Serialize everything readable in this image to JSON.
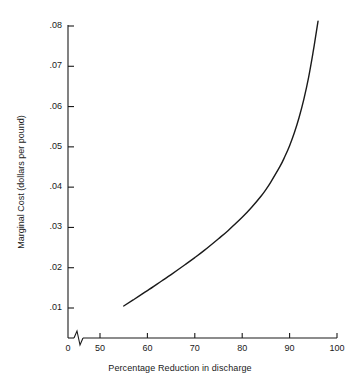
{
  "chart_data": {
    "type": "line",
    "title": "",
    "subtitle": "",
    "xlabel": "Percentage Reduction in discharge",
    "ylabel": "Marginal Cost (dollars per pound)",
    "xlim": [
      50,
      100
    ],
    "ylim": [
      0,
      0.08
    ],
    "grid": false,
    "legend": "none",
    "x_axis_break": true,
    "x_axis_break_note": "axis broken between 0 and 50",
    "xticks": [
      "0",
      "50",
      "60",
      "70",
      "80",
      "90",
      "100"
    ],
    "xtick_values": [
      0,
      50,
      60,
      70,
      80,
      90,
      100
    ],
    "yticks": [
      ".01",
      ".02",
      ".03",
      ".04",
      ".05",
      ".06",
      ".07",
      ".08"
    ],
    "ytick_values": [
      0.01,
      0.02,
      0.03,
      0.04,
      0.05,
      0.06,
      0.07,
      0.08
    ],
    "series": [
      {
        "name": "Marginal Cost",
        "color": "#1a1a1a",
        "x": [
          55,
          57,
          60,
          63,
          65,
          68,
          70,
          72,
          75,
          77,
          80,
          82,
          84,
          85,
          86,
          88,
          89,
          90,
          91,
          92,
          93,
          94,
          95,
          95.5,
          96
        ],
        "values": [
          0.0105,
          0.012,
          0.0143,
          0.0167,
          0.0183,
          0.0208,
          0.0225,
          0.0243,
          0.0272,
          0.0292,
          0.0325,
          0.035,
          0.0378,
          0.0394,
          0.0412,
          0.0452,
          0.0476,
          0.0503,
          0.0535,
          0.0573,
          0.0618,
          0.0672,
          0.0738,
          0.0775,
          0.0812
        ]
      }
    ],
    "annotations": []
  },
  "axis": {
    "y_title": "Marginal Cost (dollars per pound)",
    "x_title": "Percentage Reduction in discharge",
    "y_tick_labels": [
      ".08",
      ".07",
      ".06",
      ".05",
      ".04",
      ".03",
      ".02",
      ".01"
    ],
    "x_tick_labels": [
      "0",
      "50",
      "60",
      "70",
      "80",
      "90",
      "100"
    ]
  },
  "style": {
    "background": "#ffffff",
    "line_color": "#1a1a1a",
    "axis_color": "#1a1a1a",
    "text_color": "#1a1a1a"
  }
}
